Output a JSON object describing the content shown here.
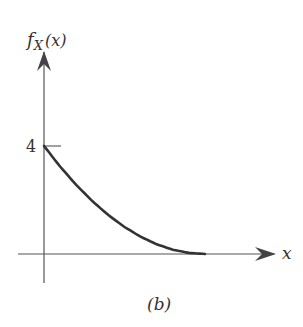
{
  "figure": {
    "caption": "(b)",
    "ylabel_main": "f",
    "ylabel_sub": "X",
    "ylabel_arg": "(x)",
    "xlabel": "x",
    "ytick_label": "4"
  },
  "chart_data": {
    "type": "line",
    "title": "",
    "caption": "(b)",
    "xlabel": "x",
    "ylabel": "f_X(x)",
    "yticks": [
      4
    ],
    "ytick_labels": [
      "4"
    ],
    "xticks": [],
    "grid": false,
    "legend": null,
    "series": [
      {
        "name": "f_X(x)",
        "x": [
          0,
          0.075,
          0.15,
          0.225,
          0.3,
          0.375,
          0.45,
          0.525,
          0.6,
          0.675,
          0.75
        ],
        "values": [
          4.0,
          3.24,
          2.56,
          1.96,
          1.44,
          1.0,
          0.64,
          0.36,
          0.16,
          0.04,
          0.0
        ]
      }
    ],
    "xlim": [
      -0.15,
      1.3
    ],
    "ylim": [
      -1.2,
      7.5
    ]
  }
}
